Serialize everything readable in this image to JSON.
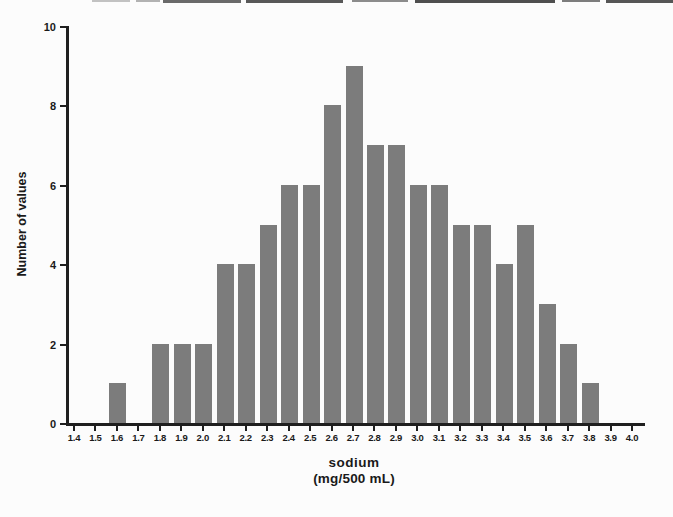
{
  "page": {
    "background": "#fcfcfc"
  },
  "chart_data": {
    "type": "bar",
    "title": "",
    "categories": [
      "1.4",
      "1.5",
      "1.6",
      "1.7",
      "1.8",
      "1.9",
      "2.0",
      "2.1",
      "2.2",
      "2.3",
      "2.4",
      "2.5",
      "2.6",
      "2.7",
      "2.8",
      "2.9",
      "3.0",
      "3.1",
      "3.2",
      "3.3",
      "3.4",
      "3.5",
      "3.6",
      "3.7",
      "3.8",
      "3.9",
      "4.0"
    ],
    "values": [
      0,
      0,
      1,
      0,
      2,
      2,
      2,
      4,
      4,
      5,
      6,
      6,
      8,
      9,
      7,
      7,
      6,
      6,
      5,
      5,
      4,
      5,
      3,
      2,
      1,
      0,
      0
    ],
    "ylabel": "Number of values",
    "xlabel": "sodium",
    "xlabel_unit": "(mg/500 mL)",
    "ylim": [
      0,
      10
    ],
    "ytick_values": [
      0,
      2,
      4,
      6,
      8,
      10
    ],
    "xtick_step": 0.1,
    "grid": false,
    "legend": false,
    "bar_color": "#7c7c7c",
    "axis_color": "#1f1f1f",
    "text_color": "#1a1a1a"
  }
}
